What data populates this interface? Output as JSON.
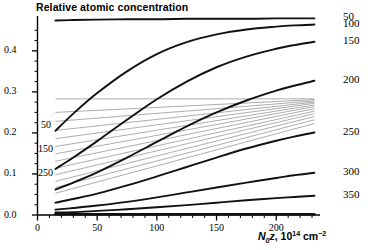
{
  "chart_data": {
    "type": "line",
    "title": "Relative atomic concentration",
    "xlabel": "N0z, 10^14 cm^-2",
    "xlabel_parts": {
      "n": "N",
      "sub": "0",
      "z": "z",
      "comma": ", ",
      "ten": "10",
      "exp": "14",
      "unit": "cm",
      "unitexp": "-2"
    },
    "ylabel": "",
    "xlim": [
      0,
      235
    ],
    "ylim": [
      0,
      0.48
    ],
    "xticks": [
      0,
      50,
      100,
      150,
      200
    ],
    "xtick_labels": [
      "0",
      "50",
      "100",
      "150",
      "200"
    ],
    "xminor_step": 10,
    "yticks": [
      0.0,
      0.1,
      0.2,
      0.3,
      0.4
    ],
    "ytick_labels": [
      "0.0",
      "0.1",
      "0.2",
      "0.3",
      "0.4"
    ],
    "yminor_step": 0.025,
    "grid": false,
    "legend_position": "right-of-axes",
    "series_labels_right": [
      "50",
      "100",
      "150",
      "200",
      "250",
      "300",
      "350"
    ],
    "series_labels_inner": [
      "50",
      "150",
      "250"
    ],
    "series": [
      {
        "name": "50",
        "color": "#111111",
        "width": 1.9,
        "x": [
          15,
          30,
          50,
          75,
          100,
          125,
          150,
          175,
          200,
          215,
          232
        ],
        "y": [
          0.474,
          0.475,
          0.476,
          0.477,
          0.477,
          0.478,
          0.478,
          0.478,
          0.479,
          0.479,
          0.479
        ]
      },
      {
        "name": "100",
        "color": "#111111",
        "width": 1.9,
        "x": [
          15,
          30,
          50,
          75,
          100,
          125,
          150,
          175,
          200,
          215,
          232
        ],
        "y": [
          0.205,
          0.247,
          0.297,
          0.35,
          0.392,
          0.421,
          0.44,
          0.452,
          0.459,
          0.462,
          0.464
        ]
      },
      {
        "name": "150",
        "color": "#111111",
        "width": 1.9,
        "x": [
          15,
          30,
          50,
          75,
          100,
          125,
          150,
          175,
          200,
          215,
          232
        ],
        "y": [
          0.112,
          0.14,
          0.18,
          0.232,
          0.282,
          0.325,
          0.36,
          0.386,
          0.405,
          0.414,
          0.422
        ]
      },
      {
        "name": "200",
        "color": "#111111",
        "width": 1.9,
        "x": [
          15,
          30,
          50,
          75,
          100,
          125,
          150,
          175,
          200,
          215,
          232
        ],
        "y": [
          0.062,
          0.079,
          0.104,
          0.14,
          0.178,
          0.216,
          0.25,
          0.279,
          0.303,
          0.315,
          0.327
        ]
      },
      {
        "name": "250",
        "color": "#111111",
        "width": 1.9,
        "x": [
          15,
          30,
          50,
          75,
          100,
          125,
          150,
          175,
          200,
          215,
          232
        ],
        "y": [
          0.03,
          0.039,
          0.052,
          0.072,
          0.094,
          0.117,
          0.14,
          0.162,
          0.181,
          0.191,
          0.201
        ]
      },
      {
        "name": "300",
        "color": "#111111",
        "width": 1.9,
        "x": [
          15,
          30,
          50,
          75,
          100,
          125,
          150,
          175,
          200,
          215,
          232
        ],
        "y": [
          0.013,
          0.017,
          0.023,
          0.032,
          0.043,
          0.055,
          0.067,
          0.079,
          0.09,
          0.097,
          0.103
        ]
      },
      {
        "name": "350",
        "color": "#111111",
        "width": 1.9,
        "x": [
          15,
          30,
          50,
          75,
          100,
          125,
          150,
          175,
          200,
          215,
          232
        ],
        "y": [
          0.006,
          0.007,
          0.01,
          0.014,
          0.019,
          0.024,
          0.03,
          0.036,
          0.041,
          0.044,
          0.047
        ]
      },
      {
        "name": "baseline",
        "color": "#111111",
        "width": 2.6,
        "x": [
          15,
          60,
          120,
          180,
          232
        ],
        "y": [
          0.002,
          0.002,
          0.002,
          0.002,
          0.002
        ]
      }
    ],
    "thin_series": [
      {
        "name": "t1",
        "color": "#8a8a8a",
        "width": 0.7,
        "x": [
          15,
          232
        ],
        "y": [
          0.283,
          0.283
        ]
      },
      {
        "name": "t2",
        "color": "#8a8a8a",
        "width": 0.7,
        "x": [
          15,
          232
        ],
        "y": [
          0.25,
          0.281
        ]
      },
      {
        "name": "t3",
        "color": "#8a8a8a",
        "width": 0.7,
        "x": [
          15,
          232
        ],
        "y": [
          0.228,
          0.278
        ]
      },
      {
        "name": "t4",
        "color": "#8a8a8a",
        "width": 0.7,
        "x": [
          15,
          232
        ],
        "y": [
          0.206,
          0.275
        ]
      },
      {
        "name": "t5",
        "color": "#8a8a8a",
        "width": 0.7,
        "x": [
          15,
          232
        ],
        "y": [
          0.186,
          0.272
        ]
      },
      {
        "name": "t6",
        "color": "#8a8a8a",
        "width": 0.7,
        "x": [
          15,
          232
        ],
        "y": [
          0.167,
          0.268
        ]
      },
      {
        "name": "t7",
        "color": "#8a8a8a",
        "width": 0.7,
        "x": [
          15,
          232
        ],
        "y": [
          0.149,
          0.264
        ]
      },
      {
        "name": "t8",
        "color": "#8a8a8a",
        "width": 0.7,
        "x": [
          15,
          232
        ],
        "y": [
          0.131,
          0.259
        ]
      },
      {
        "name": "t9",
        "color": "#8a8a8a",
        "width": 0.7,
        "x": [
          15,
          232
        ],
        "y": [
          0.114,
          0.253
        ]
      },
      {
        "name": "t10",
        "color": "#8a8a8a",
        "width": 0.7,
        "x": [
          15,
          232
        ],
        "y": [
          0.098,
          0.247
        ]
      },
      {
        "name": "t11",
        "color": "#8a8a8a",
        "width": 0.7,
        "x": [
          15,
          232
        ],
        "y": [
          0.082,
          0.24
        ]
      },
      {
        "name": "t12",
        "color": "#8a8a8a",
        "width": 0.7,
        "x": [
          15,
          232
        ],
        "y": [
          0.067,
          0.232
        ]
      },
      {
        "name": "t13",
        "color": "#8a8a8a",
        "width": 0.7,
        "x": [
          15,
          232
        ],
        "y": [
          0.053,
          0.223
        ]
      }
    ]
  },
  "axis_title": "Relative atomic concentration"
}
